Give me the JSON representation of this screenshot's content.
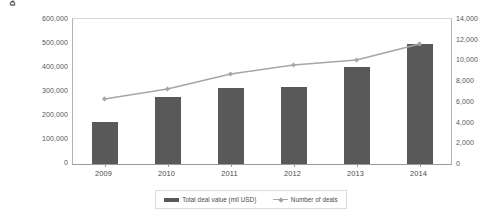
{
  "chart_data": {
    "type": "bar",
    "title": "",
    "categories": [
      "2009",
      "2010",
      "2011",
      "2012",
      "2013",
      "2014"
    ],
    "series": [
      {
        "name": "Total deal value (mil USD)",
        "type": "bar",
        "axis": "left",
        "color": "#595959",
        "values": [
          174000,
          277000,
          315000,
          320000,
          401000,
          496000
        ]
      },
      {
        "name": "Number of deals",
        "type": "line",
        "axis": "right",
        "color": "#a6a6a6",
        "values": [
          6280,
          7240,
          8690,
          9560,
          10040,
          11590
        ]
      }
    ],
    "xlabel": "",
    "ylabel": "Deal value (mil USD)",
    "y2label": "",
    "ylim": [
      0,
      600000
    ],
    "y2lim": [
      0,
      14000
    ],
    "yticks": [
      "0",
      "100,000",
      "200,000",
      "300,000",
      "400,000",
      "500,000",
      "600,000"
    ],
    "y2ticks": [
      "0",
      "2,000",
      "4,000",
      "6,000",
      "8,000",
      "10,000",
      "12,000",
      "14,000"
    ],
    "grid": false,
    "legend_position": "bottom"
  },
  "axes": {
    "left": {
      "title": "Deal value (mil USD)",
      "ticks": [
        "600,000",
        "500,000",
        "400,000",
        "300,000",
        "200,000",
        "100,000",
        "0"
      ]
    },
    "right": {
      "title": "",
      "ticks": [
        "14,000",
        "12,000",
        "10,000",
        "8,000",
        "6,000",
        "4,000",
        "2,000",
        "0"
      ]
    },
    "category": {
      "labels": [
        "2009",
        "2010",
        "2011",
        "2012",
        "2013",
        "2014"
      ]
    }
  },
  "legend": {
    "items": [
      {
        "label": "Total deal value (mil USD)",
        "marker": "bar-swatch-icon"
      },
      {
        "label": "Number of deals",
        "marker": "line-marker-icon"
      }
    ]
  }
}
